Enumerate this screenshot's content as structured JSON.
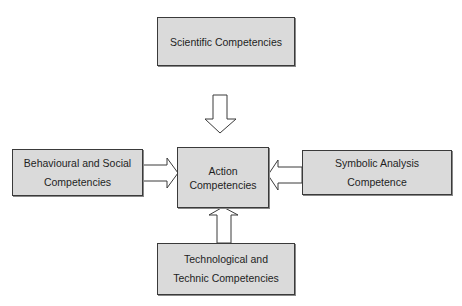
{
  "diagram": {
    "nodes": {
      "top": {
        "lines": [
          "Scientific Competencies"
        ]
      },
      "left": {
        "lines": [
          "Behavioural and Social",
          "Competencies"
        ]
      },
      "center": {
        "lines": [
          "Action",
          "Competencies"
        ]
      },
      "right": {
        "lines": [
          "Symbolic Analysis",
          "Competence"
        ]
      },
      "bottom": {
        "lines": [
          "Technological and",
          "Technic Competencies"
        ]
      }
    },
    "edges": [
      {
        "from": "Scientific Competencies",
        "to": "Action Competencies",
        "direction": "down"
      },
      {
        "from": "Behavioural and Social Competencies",
        "to": "Action Competencies",
        "direction": "right"
      },
      {
        "from": "Symbolic Analysis Competence",
        "to": "Action Competencies",
        "direction": "left"
      },
      {
        "from": "Technological and Technic Competencies",
        "to": "Action Competencies",
        "direction": "up"
      }
    ],
    "colors": {
      "box_fill": "#dadada",
      "border": "#3a3a3a",
      "arrow_fill": "#ffffff"
    }
  }
}
